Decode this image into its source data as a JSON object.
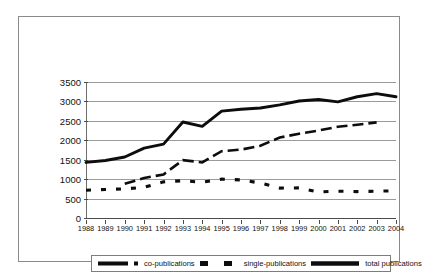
{
  "chart_data": {
    "type": "line",
    "title": "",
    "xlabel": "",
    "ylabel": "",
    "grid": true,
    "legend_position": "bottom",
    "x": [
      1988,
      1989,
      1990,
      1991,
      1992,
      1993,
      1994,
      1995,
      1996,
      1997,
      1998,
      1999,
      2000,
      2001,
      2002,
      2003,
      2004
    ],
    "xlim": [
      1988,
      2004
    ],
    "ylim": [
      0,
      3500
    ],
    "xticks": [
      "1988",
      "1989",
      "1990",
      "1991",
      "1992",
      "1993",
      "1994",
      "1995",
      "1996",
      "1997",
      "1998",
      "1999",
      "2000",
      "2001",
      "2002",
      "2003",
      "2004"
    ],
    "yticks": [
      "0",
      "500",
      "1000",
      "1500",
      "2000",
      "2500",
      "3000",
      "3500"
    ],
    "series": [
      {
        "name": "co-publications",
        "style": "dashed",
        "x": [
          1990,
          1991,
          1992,
          1993,
          1994,
          1995,
          1996,
          1997,
          1998,
          1999,
          2000,
          2001,
          2002,
          2003
        ],
        "values": [
          880,
          1030,
          1120,
          1490,
          1430,
          1720,
          1760,
          1860,
          2070,
          2170,
          2250,
          2350,
          2400,
          2460
        ]
      },
      {
        "name": "single-publications",
        "style": "dotted",
        "x": [
          1988,
          1989,
          1990,
          1991,
          1992,
          1993,
          1994,
          1995,
          1996,
          1997,
          1998,
          1999,
          2000,
          2001,
          2002,
          2003,
          2004
        ],
        "values": [
          715,
          735,
          750,
          790,
          930,
          960,
          920,
          1000,
          980,
          900,
          770,
          775,
          670,
          690,
          680,
          690,
          700
        ]
      },
      {
        "name": "total publications",
        "style": "solid",
        "x": [
          1988,
          1989,
          1990,
          1991,
          1992,
          1993,
          1994,
          1995,
          1996,
          1997,
          1998,
          1999,
          2000,
          2001,
          2002,
          2003,
          2004
        ],
        "values": [
          1430,
          1480,
          1570,
          1800,
          1900,
          2470,
          2360,
          2750,
          2800,
          2830,
          2910,
          3010,
          3050,
          2990,
          3120,
          3200,
          3120
        ]
      }
    ]
  },
  "legend": {
    "items": [
      {
        "label": "co-publications",
        "key": "dashed-line-key"
      },
      {
        "label": "single-publications",
        "key": "dotted-square-key"
      },
      {
        "label": "total publications",
        "key": "solid-line-key"
      }
    ]
  }
}
